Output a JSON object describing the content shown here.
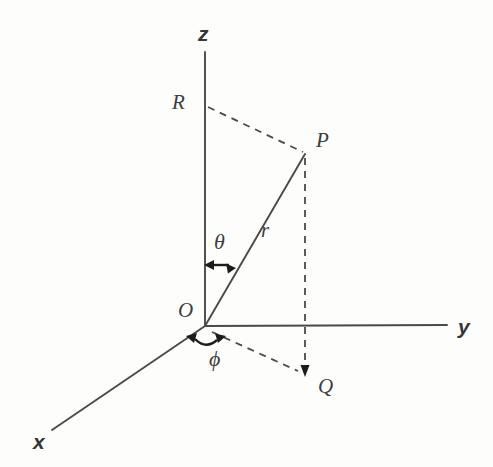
{
  "diagram": {
    "type": "geometry-diagram",
    "background_color": "#fdfdfc",
    "line_color": "#4a4a4a",
    "label_color": "#3d3d3d",
    "axes": [
      {
        "name": "z",
        "label": "z",
        "from": [
          205,
          326
        ],
        "to": [
          205,
          52
        ]
      },
      {
        "name": "y",
        "label": "y",
        "from": [
          205,
          326
        ],
        "to": [
          447,
          325
        ]
      },
      {
        "name": "x",
        "label": "x",
        "from": [
          205,
          326
        ],
        "to": [
          52,
          430
        ]
      }
    ],
    "points": [
      {
        "name": "O",
        "label": "O",
        "at": [
          205,
          326
        ],
        "label_at": [
          178,
          300
        ]
      },
      {
        "name": "P",
        "label": "P",
        "at": [
          305,
          154
        ],
        "label_at": [
          314,
          130
        ]
      },
      {
        "name": "Q",
        "label": "Q",
        "at": [
          305,
          375
        ],
        "label_at": [
          317,
          376
        ]
      },
      {
        "name": "R",
        "label": "R",
        "at": [
          205,
          107
        ],
        "label_at": [
          170,
          92
        ]
      }
    ],
    "segments": [
      {
        "name": "radius-OP",
        "style": "solid",
        "from": [
          205,
          326
        ],
        "to": [
          305,
          154
        ]
      },
      {
        "name": "RP-projection",
        "style": "dashed",
        "from": [
          207,
          107
        ],
        "to": [
          303,
          152
        ]
      },
      {
        "name": "PQ-vertical",
        "style": "dashed",
        "from": [
          305,
          156
        ],
        "to": [
          305,
          373
        ]
      },
      {
        "name": "OQ-projection",
        "style": "dashed",
        "from": [
          210,
          331
        ],
        "to": [
          303,
          373
        ]
      }
    ],
    "angles": [
      {
        "name": "theta",
        "label": "θ",
        "label_at": [
          215,
          232
        ],
        "between": [
          "z-axis",
          "radius-OP"
        ]
      },
      {
        "name": "phi",
        "label": "ϕ",
        "label_at": [
          210,
          348
        ],
        "between": [
          "x-axis",
          "OQ-projection"
        ]
      }
    ],
    "lengths": [
      {
        "name": "r",
        "label": "r",
        "label_at": [
          261,
          220
        ],
        "of": "radius-OP"
      }
    ]
  }
}
